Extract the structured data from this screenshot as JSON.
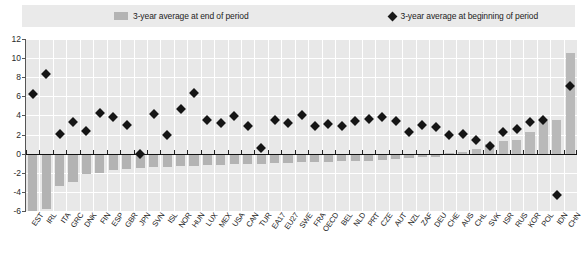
{
  "legend": {
    "bar_label": "3-year average at end of period",
    "marker_label": "3-year average at beginning of period",
    "bar_color": "#b4b4b4",
    "marker_color": "#1a1a1a"
  },
  "chart_data": {
    "type": "bar",
    "title": "",
    "subtitle": "",
    "xlabel": "",
    "ylabel": "",
    "ylim": [
      -6,
      12
    ],
    "ytick_step": 2,
    "yticks": [
      "12",
      "10",
      "8",
      "6",
      "4",
      "2",
      "0",
      "-2",
      "-4",
      "-6"
    ],
    "ytick_values": [
      12,
      10,
      8,
      6,
      4,
      2,
      0,
      -2,
      -4,
      -6
    ],
    "grid": true,
    "legend_position": "top",
    "categories": [
      "EST",
      "IRL",
      "ITA",
      "GRC",
      "DNK",
      "FIN",
      "ESP",
      "GBR",
      "JPN",
      "SVN",
      "ISL",
      "NOR",
      "HUN",
      "LUX",
      "MEX",
      "USA",
      "CAN",
      "TUR",
      "EA17",
      "EU27",
      "SWE",
      "FRA",
      "OECD",
      "BEL",
      "NLD",
      "PRT",
      "CZE",
      "AUT",
      "NZL",
      "ZAF",
      "DEU",
      "CHE",
      "AUS",
      "CHL",
      "SVK",
      "ISR",
      "RUS",
      "KOR",
      "POL",
      "IDN",
      "CHN"
    ],
    "series": [
      {
        "name": "3-year average at end of period",
        "type": "bar",
        "values": [
          -6.6,
          -5.8,
          -3.4,
          -3.0,
          -2.1,
          -2.0,
          -1.7,
          -1.6,
          -1.5,
          -1.4,
          -1.4,
          -1.3,
          -1.3,
          -1.2,
          -1.2,
          -1.1,
          -1.1,
          -1.1,
          -1.0,
          -1.0,
          -0.9,
          -0.9,
          -0.9,
          -0.8,
          -0.8,
          -0.8,
          -0.7,
          -0.6,
          -0.5,
          -0.4,
          -0.3,
          0.1,
          0.2,
          0.5,
          1.0,
          1.3,
          1.4,
          2.3,
          3.4,
          3.5,
          10.5
        ]
      },
      {
        "name": "3-year average at beginning of period",
        "type": "scatter",
        "values": [
          6.2,
          8.3,
          2.1,
          3.3,
          2.4,
          4.3,
          3.8,
          3.0,
          0.0,
          4.1,
          2.0,
          4.7,
          6.3,
          3.5,
          3.2,
          3.9,
          2.9,
          0.6,
          3.5,
          3.2,
          4.0,
          2.9,
          3.1,
          2.9,
          3.4,
          3.6,
          3.8,
          3.4,
          2.3,
          3.0,
          2.8,
          2.0,
          2.1,
          1.4,
          0.8,
          2.3,
          2.6,
          3.3,
          3.5,
          -4.3,
          7.1
        ]
      }
    ]
  }
}
